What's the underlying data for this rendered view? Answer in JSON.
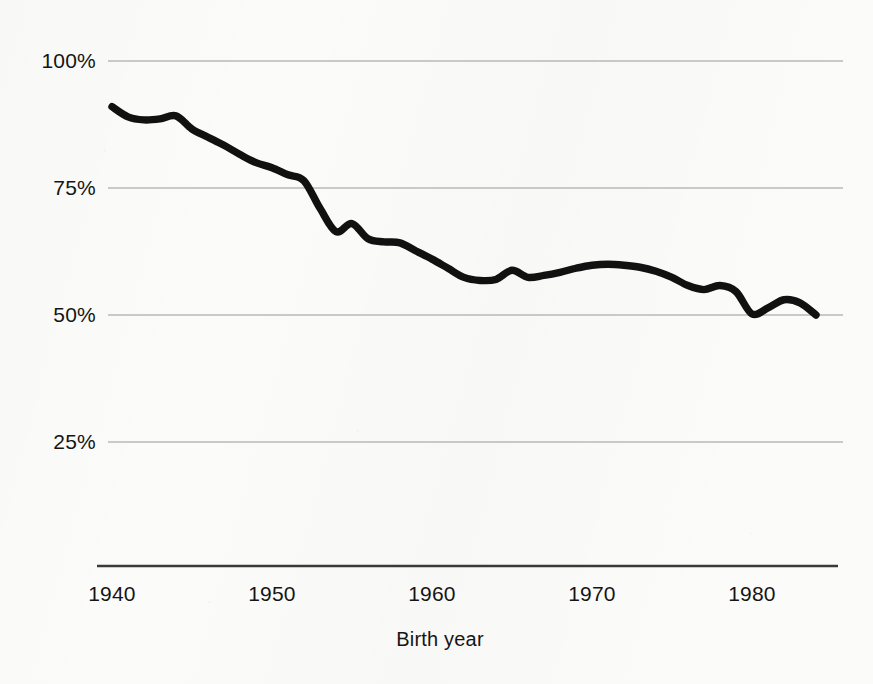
{
  "chart_data": {
    "type": "line",
    "title": "",
    "subtitle": "",
    "xlabel": "Birth year",
    "ylabel": "",
    "xlim": [
      1940,
      1984
    ],
    "ylim": [
      0,
      100
    ],
    "grid": "horizontal",
    "legend": "none",
    "line_color": "#111111",
    "grid_color": "#b9b9b9",
    "axis_color": "#3a3a3a",
    "background_color": "#fbfbfa",
    "y_ticks": [
      {
        "value": 100,
        "label": "100%"
      },
      {
        "value": 75,
        "label": "75%"
      },
      {
        "value": 50,
        "label": "50%"
      },
      {
        "value": 25,
        "label": "25%"
      }
    ],
    "x_ticks": [
      {
        "value": 1940,
        "label": "1940"
      },
      {
        "value": 1950,
        "label": "1950"
      },
      {
        "value": 1960,
        "label": "1960"
      },
      {
        "value": 1970,
        "label": "1970"
      },
      {
        "value": 1980,
        "label": "1980"
      }
    ],
    "series": [
      {
        "name": "share",
        "x": [
          1940,
          1941,
          1942,
          1943,
          1944,
          1945,
          1946,
          1947,
          1948,
          1949,
          1950,
          1951,
          1952,
          1953,
          1954,
          1955,
          1956,
          1957,
          1958,
          1959,
          1960,
          1961,
          1962,
          1963,
          1964,
          1965,
          1966,
          1967,
          1968,
          1969,
          1970,
          1971,
          1972,
          1973,
          1974,
          1975,
          1976,
          1977,
          1978,
          1979,
          1980,
          1981,
          1982,
          1983,
          1984
        ],
        "values": [
          91.0,
          89.0,
          88.4,
          88.6,
          89.2,
          86.6,
          85.0,
          83.4,
          81.6,
          80.0,
          79.0,
          77.6,
          76.4,
          71.0,
          66.4,
          68.0,
          65.0,
          64.4,
          64.2,
          62.6,
          61.0,
          59.2,
          57.4,
          56.8,
          57.0,
          58.8,
          57.4,
          57.8,
          58.4,
          59.2,
          59.8,
          60.0,
          59.8,
          59.4,
          58.6,
          57.4,
          55.8,
          55.0,
          55.8,
          54.6,
          50.2,
          51.4,
          53.0,
          52.4,
          50.0
        ]
      }
    ]
  },
  "axes": {
    "x_title": "Birth year"
  }
}
